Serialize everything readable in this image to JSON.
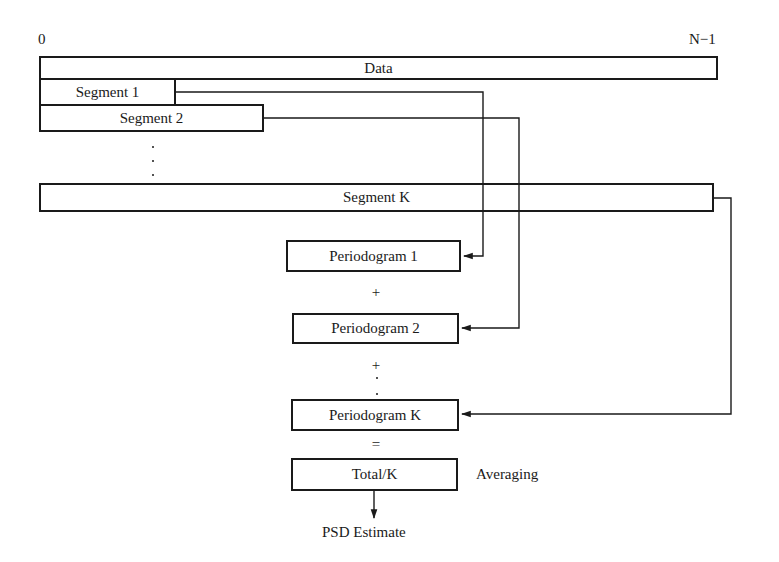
{
  "diagram": {
    "line_color": "#1a1a1a",
    "background_color": "#ffffff",
    "axis_labels": {
      "start": "0",
      "end": "N−1"
    },
    "boxes": [
      {
        "id": "data",
        "label": "Data",
        "x": 40,
        "y": 57,
        "w": 677,
        "h": 22
      },
      {
        "id": "segment-1",
        "label": "Segment 1",
        "x": 40,
        "y": 79,
        "w": 135,
        "h": 26
      },
      {
        "id": "segment-2",
        "label": "Segment 2",
        "x": 40,
        "y": 105,
        "w": 223,
        "h": 26
      },
      {
        "id": "segment-k",
        "label": "Segment K",
        "x": 40,
        "y": 184,
        "w": 673,
        "h": 27
      },
      {
        "id": "periodogram-1",
        "label": "Periodogram 1",
        "x": 287,
        "y": 241,
        "w": 173,
        "h": 30
      },
      {
        "id": "periodogram-2",
        "label": "Periodogram  2",
        "x": 293,
        "y": 314,
        "w": 165,
        "h": 29
      },
      {
        "id": "periodogram-k",
        "label": "Periodogram K",
        "x": 292,
        "y": 400,
        "w": 166,
        "h": 30
      },
      {
        "id": "total-k",
        "label": "Total/K",
        "x": 292,
        "y": 459,
        "w": 165,
        "h": 31
      }
    ],
    "operators": [
      {
        "id": "plus-1",
        "label": "+",
        "x": 376,
        "y": 291
      },
      {
        "id": "plus-2",
        "label": "+",
        "x": 376,
        "y": 364
      },
      {
        "id": "equals",
        "label": "=",
        "x": 376,
        "y": 443
      }
    ],
    "annotations": [
      {
        "id": "averaging",
        "label": "Averaging",
        "x": 476,
        "y": 473
      },
      {
        "id": "psd-estimate",
        "label": "PSD Estimate",
        "x": 376,
        "y": 533
      }
    ],
    "ellipses": [
      {
        "id": "segments-ellipsis",
        "x": 152,
        "y": 147
      },
      {
        "id": "periodograms-ellipsis",
        "x": 376,
        "y": 381
      }
    ]
  }
}
